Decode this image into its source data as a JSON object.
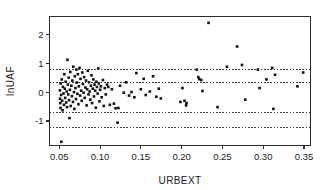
{
  "chart_data": {
    "type": "scatter",
    "title": "",
    "xlabel": "URBEXT",
    "ylabel": "lnUAF",
    "xlim": [
      0.038,
      0.358
    ],
    "ylim": [
      -1.85,
      2.62
    ],
    "grid": false,
    "legend": "none",
    "xticks": [
      0.05,
      0.1,
      0.15,
      0.2,
      0.25,
      0.3,
      0.35
    ],
    "xtick_labels": [
      "0.05",
      "0.10",
      "0.15",
      "0.20",
      "0.25",
      "0.30",
      "0.35"
    ],
    "yticks": [
      2,
      1,
      0,
      -1
    ],
    "ytick_labels": [
      "2",
      "1",
      "0",
      "-1"
    ],
    "reference_lines": [
      {
        "name": "upper-outer-limit",
        "y": 0.78,
        "style": "dotted"
      },
      {
        "name": "upper-inner-limit",
        "y": 0.33,
        "style": "dotted"
      },
      {
        "name": "lower-inner-limit",
        "y": -0.72,
        "style": "dotted"
      },
      {
        "name": "lower-outer-limit",
        "y": -1.21,
        "style": "dotted"
      }
    ],
    "marker": {
      "shape": "square",
      "size_px": 2.6,
      "color": "#111111"
    },
    "points": [
      [
        0.0525,
        -1.72
      ],
      [
        0.0508,
        0.06
      ],
      [
        0.051,
        -0.23
      ],
      [
        0.0512,
        -0.38
      ],
      [
        0.0515,
        -0.55
      ],
      [
        0.0518,
        0.3
      ],
      [
        0.0522,
        -0.1
      ],
      [
        0.053,
        0.44
      ],
      [
        0.0535,
        -0.3
      ],
      [
        0.054,
        -0.63
      ],
      [
        0.0545,
        0.18
      ],
      [
        0.0552,
        -0.05
      ],
      [
        0.0558,
        -0.44
      ],
      [
        0.0562,
        0.62
      ],
      [
        0.0568,
        0.12
      ],
      [
        0.0572,
        -0.2
      ],
      [
        0.0578,
        0.36
      ],
      [
        0.0585,
        -0.36
      ],
      [
        0.059,
        0.02
      ],
      [
        0.0595,
        -0.52
      ],
      [
        0.06,
        1.12
      ],
      [
        0.0605,
        0.26
      ],
      [
        0.061,
        -0.08
      ],
      [
        0.0615,
        0.5
      ],
      [
        0.062,
        -0.28
      ],
      [
        0.0625,
        -0.9
      ],
      [
        0.063,
        0.08
      ],
      [
        0.0635,
        0.7
      ],
      [
        0.064,
        -0.48
      ],
      [
        0.0648,
        0.22
      ],
      [
        0.0655,
        -0.14
      ],
      [
        0.066,
        0.4
      ],
      [
        0.0668,
        -0.34
      ],
      [
        0.0672,
        0.88
      ],
      [
        0.068,
        0.0
      ],
      [
        0.0685,
        -0.58
      ],
      [
        0.069,
        0.55
      ],
      [
        0.0698,
        0.14
      ],
      [
        0.0705,
        -0.24
      ],
      [
        0.071,
        0.78
      ],
      [
        0.0715,
        0.33
      ],
      [
        0.0722,
        -0.06
      ],
      [
        0.0728,
        0.62
      ],
      [
        0.0735,
        -0.42
      ],
      [
        0.074,
        0.2
      ],
      [
        0.0748,
        0.84
      ],
      [
        0.0755,
        -0.12
      ],
      [
        0.076,
        0.46
      ],
      [
        0.0768,
        0.05
      ],
      [
        0.0775,
        -0.3
      ],
      [
        0.0782,
        0.68
      ],
      [
        0.079,
        0.28
      ],
      [
        0.0798,
        -0.02
      ],
      [
        0.0805,
        0.52
      ],
      [
        0.0812,
        -0.2
      ],
      [
        0.082,
        0.16
      ],
      [
        0.0828,
        0.4
      ],
      [
        0.0835,
        -0.46
      ],
      [
        0.0842,
        0.1
      ],
      [
        0.085,
        0.74
      ],
      [
        0.0858,
        -0.08
      ],
      [
        0.0865,
        0.34
      ],
      [
        0.0872,
        0.02
      ],
      [
        0.088,
        -0.26
      ],
      [
        0.0888,
        0.22
      ],
      [
        0.0895,
        0.58
      ],
      [
        0.0902,
        -0.38
      ],
      [
        0.091,
        0.12
      ],
      [
        0.0918,
        0.44
      ],
      [
        0.0925,
        -0.15
      ],
      [
        0.0932,
        0.26
      ],
      [
        0.094,
        0.05
      ],
      [
        0.0948,
        -0.54
      ],
      [
        0.0955,
        0.36
      ],
      [
        0.0962,
        0.18
      ],
      [
        0.097,
        -0.05
      ],
      [
        0.0978,
        0.82
      ],
      [
        0.0985,
        0.3
      ],
      [
        0.0992,
        -0.32
      ],
      [
        0.1,
        0.08
      ],
      [
        0.101,
        0.2
      ],
      [
        0.102,
        -0.18
      ],
      [
        0.1035,
        0.42
      ],
      [
        0.1045,
        -0.48
      ],
      [
        0.1058,
        0.14
      ],
      [
        0.107,
        -0.08
      ],
      [
        0.1085,
        0.26
      ],
      [
        0.11,
        0.18
      ],
      [
        0.112,
        -0.44
      ],
      [
        0.1145,
        0.1
      ],
      [
        0.117,
        -0.4
      ],
      [
        0.119,
        -0.56
      ],
      [
        0.1215,
        -1.06
      ],
      [
        0.1225,
        -0.55
      ],
      [
        0.1245,
        0.22
      ],
      [
        0.129,
        -0.02
      ],
      [
        0.132,
        0.34
      ],
      [
        0.1355,
        -0.12
      ],
      [
        0.1385,
        0.0
      ],
      [
        0.142,
        -0.18
      ],
      [
        0.1445,
        0.66
      ],
      [
        0.15,
        0.1
      ],
      [
        0.1535,
        0.46
      ],
      [
        0.156,
        -0.1
      ],
      [
        0.161,
        0.02
      ],
      [
        0.165,
        0.55
      ],
      [
        0.169,
        -0.16
      ],
      [
        0.172,
        0.12
      ],
      [
        0.1745,
        -0.22
      ],
      [
        0.1985,
        -0.34
      ],
      [
        0.201,
        0.14
      ],
      [
        0.2035,
        -0.3
      ],
      [
        0.2055,
        -0.46
      ],
      [
        0.206,
        -0.38
      ],
      [
        0.2185,
        0.78
      ],
      [
        0.2205,
        0.52
      ],
      [
        0.2215,
        0.45
      ],
      [
        0.224,
        0.42
      ],
      [
        0.2255,
        0.04
      ],
      [
        0.233,
        2.4
      ],
      [
        0.244,
        -0.52
      ],
      [
        0.2555,
        0.88
      ],
      [
        0.268,
        1.58
      ],
      [
        0.274,
        0.94
      ],
      [
        0.278,
        -0.26
      ],
      [
        0.2935,
        0.78
      ],
      [
        0.2955,
        0.14
      ],
      [
        0.304,
        0.44
      ],
      [
        0.311,
        0.84
      ],
      [
        0.3125,
        -0.58
      ],
      [
        0.3145,
        0.6
      ],
      [
        0.342,
        0.2
      ],
      [
        0.349,
        0.68
      ]
    ]
  },
  "figure": {
    "background_color": "#ffffff",
    "frame_color": "#2b2b2b",
    "point_count": 134
  }
}
